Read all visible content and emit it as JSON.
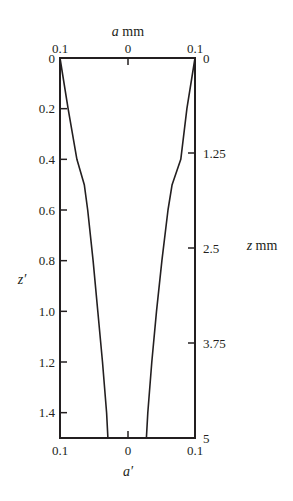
{
  "chart_data": {
    "type": "line",
    "title": "",
    "top_axis": {
      "label_var": "a",
      "label_unit": "mm",
      "ticks": [
        "0.1",
        "0",
        "0.1"
      ]
    },
    "bottom_axis": {
      "label": "a′",
      "ticks": [
        "0.1",
        "0",
        "0.1"
      ]
    },
    "left_axis": {
      "label": "z′",
      "ticks": [
        "0",
        "0.2",
        "0.4",
        "0.6",
        "0.8",
        "1.0",
        "1.2",
        "1.4"
      ],
      "range": [
        0,
        1.5
      ],
      "inverted": true
    },
    "right_axis": {
      "label_var": "z",
      "label_unit": "mm",
      "ticks": [
        "0",
        "1.25",
        "2.5",
        "3.75",
        "5"
      ],
      "range": [
        0,
        5
      ],
      "inverted": true
    },
    "xlim": [
      -0.1,
      0.1
    ],
    "ylim": [
      1.5,
      0
    ],
    "grid": false,
    "legend": null,
    "series": [
      {
        "name": "left profile (−a′)",
        "z_prime": [
          0,
          0.2,
          0.4,
          0.5,
          0.6,
          0.8,
          1.0,
          1.2,
          1.4,
          1.5
        ],
        "a_prime": [
          -0.1,
          -0.088,
          -0.075,
          -0.064,
          -0.059,
          -0.051,
          -0.044,
          -0.037,
          -0.031,
          -0.029
        ]
      },
      {
        "name": "right profile (+a′)",
        "z_prime": [
          0,
          0.2,
          0.4,
          0.5,
          0.6,
          0.8,
          1.0,
          1.2,
          1.4,
          1.5
        ],
        "a_prime": [
          0.1,
          0.088,
          0.079,
          0.066,
          0.06,
          0.051,
          0.043,
          0.036,
          0.03,
          0.028
        ]
      }
    ]
  }
}
